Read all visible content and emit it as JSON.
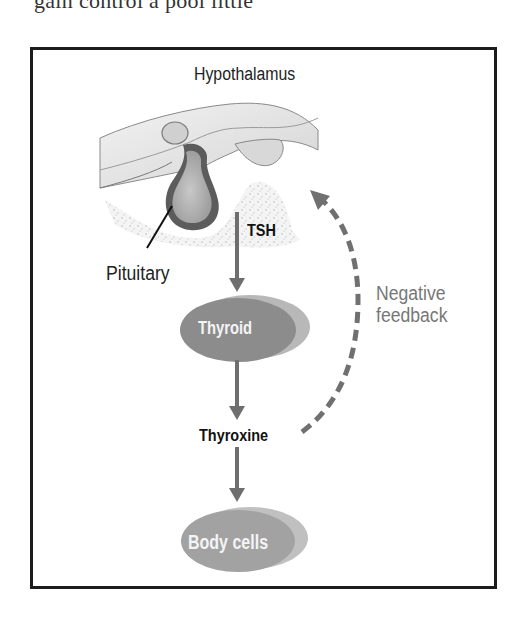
{
  "page": {
    "clipped_text_above": "gain control a pool little"
  },
  "diagram": {
    "labels": {
      "hypothalamus": "Hypothalamus",
      "pituitary": "Pituitary",
      "tsh": "TSH",
      "thyroid": "Thyroid",
      "thyroxine": "Thyroxine",
      "body_cells": "Body cells",
      "negative_feedback_line1": "Negative",
      "negative_feedback_line2": "feedback"
    },
    "flow": [
      {
        "from": "Pituitary",
        "to": "Thyroid",
        "via": "TSH",
        "style": "solid-arrow"
      },
      {
        "from": "Thyroid",
        "to": "Thyroxine",
        "style": "solid-arrow"
      },
      {
        "from": "Thyroxine",
        "to": "Body cells",
        "style": "solid-arrow"
      },
      {
        "from": "Thyroxine",
        "to": "Hypothalamus/Pituitary",
        "label": "Negative feedback",
        "style": "dashed-arrow"
      }
    ],
    "colors": {
      "frame": "#1c1c1c",
      "arrow": "#6e6e6e",
      "ellipse_dark": "#8a8a8a",
      "ellipse_light": "#b5b5b5",
      "feedback_text": "#777777"
    }
  }
}
